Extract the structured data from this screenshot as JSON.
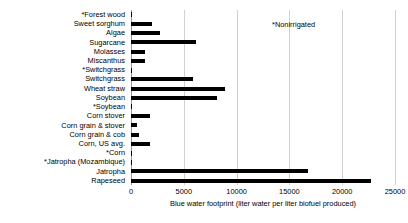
{
  "chart_data": {
    "type": "bar",
    "orientation": "horizontal",
    "title": "",
    "xlabel": "Blue water footprint (liter water per liter biofuel produced)",
    "ylabel": "",
    "xlim": [
      0,
      25000
    ],
    "xticks": [
      "0",
      "5000",
      "10000",
      "15000",
      "20000",
      "25000"
    ],
    "xtick_values": [
      0,
      5000,
      10000,
      15000,
      20000,
      25000
    ],
    "grid": true,
    "legend": false,
    "bar_color": "#000000",
    "gridline_color": "#d0d0d0",
    "categories": [
      "*Forest wood",
      "Sweet sorghum",
      "Algae",
      "Sugarcane",
      "Molasses",
      "Miscanthus",
      "*Switchgrass",
      "Switchgrass",
      "Wheat straw",
      "Soybean",
      "*Soybean",
      "Corn stover",
      "Corn grain & stover",
      "Corn grain & cob",
      "Corn, US avg.",
      "*Corn",
      "*Jatropha (Mozambique)",
      "Jatropha",
      "Rapeseed"
    ],
    "values": [
      0,
      2000,
      2700,
      6200,
      1300,
      1300,
      0,
      5900,
      8900,
      8100,
      0,
      1800,
      600,
      800,
      1800,
      0,
      0,
      16800,
      22700
    ],
    "annotations": [
      {
        "text": "*Nonirrigated",
        "x": 15000,
        "y_row": 0
      }
    ],
    "note": "Categories marked with * are nonirrigated and have a blue water footprint of approximately zero."
  },
  "axis": {
    "x_title": "Blue water footprint (liter water per liter biofuel produced)"
  },
  "annotation": {
    "nonirrigated": "*Nonirrigated"
  }
}
